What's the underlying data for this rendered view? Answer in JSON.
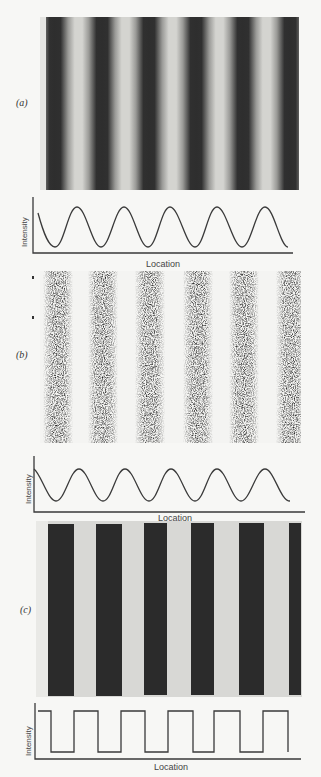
{
  "panels": [
    {
      "id": "a",
      "label": "(a)",
      "pattern": "Smooth sinusoidal grating (blurred dark/light bars)",
      "graph": {
        "xlabel": "Location",
        "ylabel": "Intensity",
        "profile": "sine"
      }
    },
    {
      "id": "b",
      "label": "(b)",
      "pattern": "Noisy/speckled sinusoidal grating",
      "graph": {
        "xlabel": "Location",
        "ylabel": "Intensity",
        "profile": "sine"
      }
    },
    {
      "id": "c",
      "label": "(c)",
      "pattern": "Sharp square-wave grating (hard-edged bars)",
      "graph": {
        "xlabel": "Location",
        "ylabel": "Intensity",
        "profile": "square"
      }
    }
  ],
  "colors": {
    "background": "#f7f7f5",
    "dark_bar": "#2b2b2b",
    "light_bar": "#d6d6d3",
    "curve": "#3a3a3a"
  }
}
